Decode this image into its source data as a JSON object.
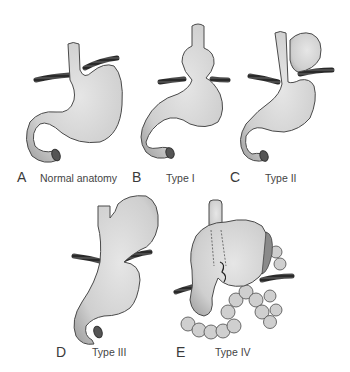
{
  "panels": [
    {
      "letter": "A",
      "caption": "Normal anatomy"
    },
    {
      "letter": "B",
      "caption": "Type I"
    },
    {
      "letter": "C",
      "caption": "Type II"
    },
    {
      "letter": "D",
      "caption": "Type III"
    },
    {
      "letter": "E",
      "caption": "Type IV"
    }
  ],
  "colors": {
    "organ_fill": "#d6d6d6",
    "organ_outline": "#4a4a4a",
    "diaphragm": "#2e2e2e",
    "background": "#ffffff"
  }
}
